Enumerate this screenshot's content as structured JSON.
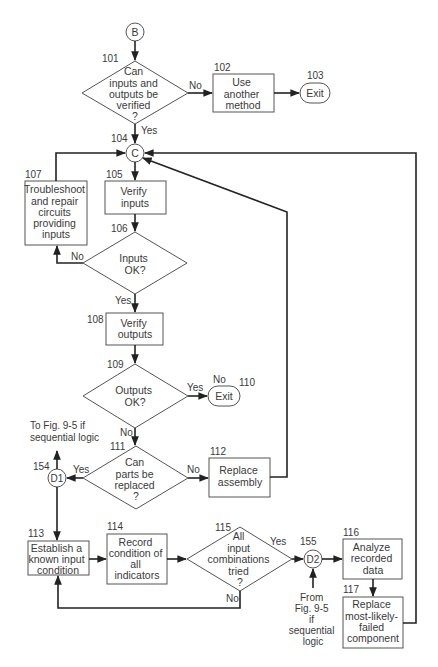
{
  "diagram": {
    "type": "flowchart",
    "connectors": {
      "B": {
        "label": "B"
      },
      "C": {
        "label": "C",
        "number": "104"
      },
      "D1": {
        "label": "D1",
        "number": "154"
      },
      "D2": {
        "label": "D2",
        "number": "155"
      }
    },
    "nodes": {
      "n101": {
        "number": "101",
        "shape": "decision",
        "lines": [
          "Can",
          "inputs and",
          "outputs be",
          "verified",
          "?"
        ]
      },
      "n102": {
        "number": "102",
        "shape": "process",
        "lines": [
          "Use",
          "another",
          "method"
        ]
      },
      "n103": {
        "number": "103",
        "shape": "terminal",
        "lines": [
          "Exit"
        ]
      },
      "n105": {
        "number": "105",
        "shape": "process",
        "lines": [
          "Verify",
          "inputs"
        ]
      },
      "n106": {
        "number": "106",
        "shape": "decision",
        "lines": [
          "Inputs",
          "OK?"
        ]
      },
      "n107": {
        "number": "107",
        "shape": "process",
        "lines": [
          "Troubleshoot",
          "and repair",
          "circuits",
          "providing",
          "inputs"
        ]
      },
      "n108": {
        "number": "108",
        "shape": "process",
        "lines": [
          "Verify",
          "outputs"
        ]
      },
      "n109": {
        "number": "109",
        "shape": "decision",
        "lines": [
          "Outputs",
          "OK?"
        ]
      },
      "n110": {
        "number": "110",
        "shape": "terminal",
        "lines": [
          "Exit"
        ]
      },
      "n111": {
        "number": "111",
        "shape": "decision",
        "lines": [
          "Can",
          "parts be",
          "replaced",
          "?"
        ]
      },
      "n112": {
        "number": "112",
        "shape": "process",
        "lines": [
          "Replace",
          "assembly"
        ]
      },
      "n113": {
        "number": "113",
        "shape": "process",
        "lines": [
          "Establish a",
          "known input",
          "condition"
        ]
      },
      "n114": {
        "number": "114",
        "shape": "process",
        "lines": [
          "Record",
          "condition of",
          "all",
          "indicators"
        ]
      },
      "n115": {
        "number": "115",
        "shape": "decision",
        "lines": [
          "All",
          "input",
          "combinations",
          "tried",
          "?"
        ]
      },
      "n116": {
        "number": "116",
        "shape": "process",
        "lines": [
          "Analyze",
          "recorded",
          "data"
        ]
      },
      "n117": {
        "number": "117",
        "shape": "process",
        "lines": [
          "Replace",
          "most-likely-",
          "failed",
          "component"
        ]
      }
    },
    "edge_labels": {
      "n101_no": "No",
      "n101_yes": "Yes",
      "n106_no": "No",
      "n106_yes": "Yes",
      "n109_yes": "Yes",
      "n109_no_top": "No",
      "n109_no": "No",
      "n111_yes": "Yes",
      "n111_no": "No",
      "n115_yes": "Yes",
      "n115_no": "No"
    },
    "annotations": {
      "to_fig": [
        "To Fig. 9-5 if",
        "sequential logic"
      ],
      "from_fig": [
        "From",
        "Fig. 9-5",
        "if",
        "sequential",
        "logic"
      ]
    }
  }
}
